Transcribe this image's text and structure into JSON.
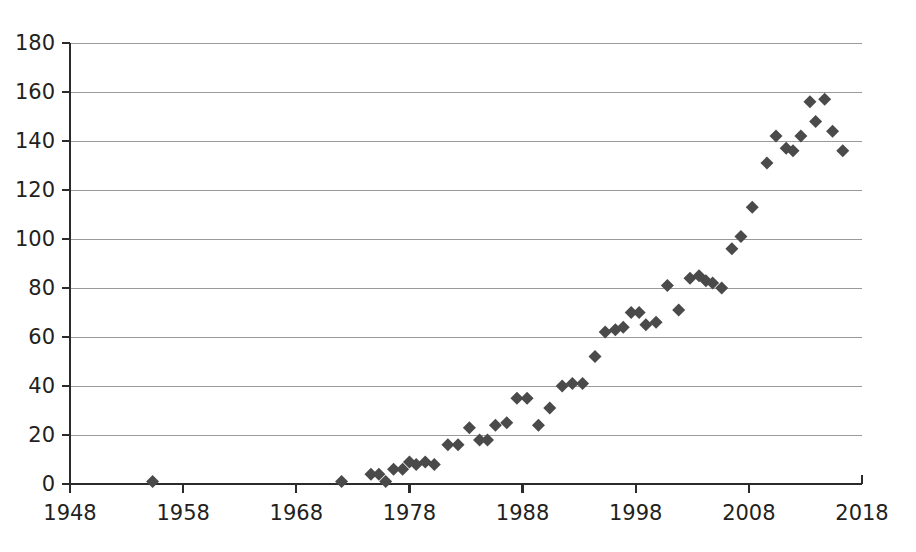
{
  "chart_data": {
    "type": "scatter",
    "title": "",
    "subtitle": "",
    "xlabel": "",
    "ylabel": "",
    "xlim": [
      1948,
      2018
    ],
    "ylim": [
      0,
      180
    ],
    "grid": "horizontal",
    "legend": "none",
    "marker": {
      "shape": "diamond",
      "color": "#4a4a4a",
      "size": 13
    },
    "axis": {
      "x_ticks": [
        1948,
        1958,
        1968,
        1978,
        1988,
        1998,
        2008,
        2018
      ],
      "x_tick_labels": [
        "1948",
        "1958",
        "1968",
        "1978",
        "1988",
        "1998",
        "2008",
        "2018"
      ],
      "x_tick_step": 10,
      "y_ticks": [
        0,
        20,
        40,
        60,
        80,
        100,
        120,
        140,
        160,
        180
      ],
      "y_tick_labels": [
        "0",
        "20",
        "40",
        "60",
        "80",
        "100",
        "120",
        "140",
        "160",
        "180"
      ],
      "y_tick_step": 20
    },
    "series": [
      {
        "name": "series-1",
        "color": "#4a4a4a",
        "points": [
          [
            1955.3,
            1
          ],
          [
            1972.0,
            1
          ],
          [
            1974.6,
            4
          ],
          [
            1975.3,
            4
          ],
          [
            1975.9,
            1
          ],
          [
            1976.6,
            6
          ],
          [
            1977.4,
            6
          ],
          [
            1978.0,
            9
          ],
          [
            1978.6,
            8
          ],
          [
            1979.4,
            9
          ],
          [
            1980.2,
            8
          ],
          [
            1981.4,
            16
          ],
          [
            1982.3,
            16
          ],
          [
            1983.3,
            23
          ],
          [
            1984.2,
            18
          ],
          [
            1984.9,
            18
          ],
          [
            1985.6,
            24
          ],
          [
            1986.6,
            25
          ],
          [
            1987.5,
            35
          ],
          [
            1988.4,
            35
          ],
          [
            1989.4,
            24
          ],
          [
            1990.4,
            31
          ],
          [
            1991.5,
            40
          ],
          [
            1992.4,
            41
          ],
          [
            1993.3,
            41
          ],
          [
            1994.4,
            52
          ],
          [
            1995.3,
            62
          ],
          [
            1996.2,
            63
          ],
          [
            1996.9,
            64
          ],
          [
            1997.6,
            70
          ],
          [
            1998.3,
            70
          ],
          [
            1998.9,
            65
          ],
          [
            1999.8,
            66
          ],
          [
            2000.8,
            81
          ],
          [
            2001.8,
            71
          ],
          [
            2002.8,
            84
          ],
          [
            2003.6,
            85
          ],
          [
            2004.2,
            83
          ],
          [
            2004.8,
            82
          ],
          [
            2005.6,
            80
          ],
          [
            2006.5,
            96
          ],
          [
            2007.3,
            101
          ],
          [
            2008.3,
            113
          ],
          [
            2009.6,
            131
          ],
          [
            2010.4,
            142
          ],
          [
            2011.3,
            137
          ],
          [
            2011.9,
            136
          ],
          [
            2012.6,
            142
          ],
          [
            2013.4,
            156
          ],
          [
            2013.9,
            148
          ],
          [
            2014.7,
            157
          ],
          [
            2015.4,
            144
          ],
          [
            2016.3,
            136
          ]
        ]
      }
    ]
  },
  "figure": {
    "background_color": "#ffffff",
    "plot_left_px": 70,
    "plot_right_px": 862,
    "plot_top_px": 43,
    "plot_bottom_px": 484
  }
}
